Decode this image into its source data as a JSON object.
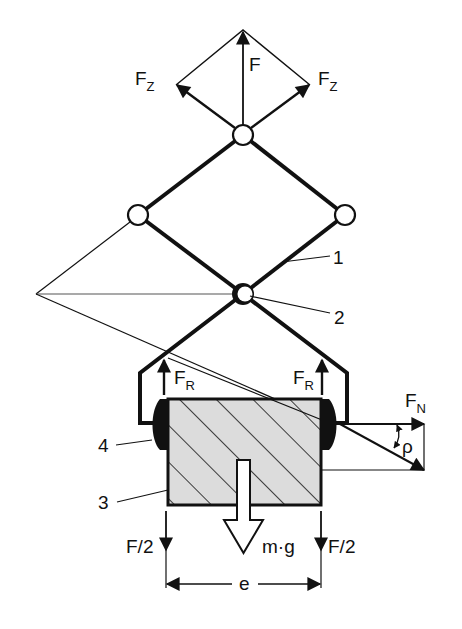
{
  "diagram": {
    "type": "mechanical-gripper-force-diagram",
    "colors": {
      "line": "#111111",
      "block_fill": "#dcdcdc",
      "background": "#ffffff"
    },
    "forces": {
      "F": {
        "main": "F",
        "sub": ""
      },
      "Fz_left": {
        "main": "F",
        "sub": "Z"
      },
      "Fz_right": {
        "main": "F",
        "sub": "Z"
      },
      "Fr_left": {
        "main": "F",
        "sub": "R"
      },
      "Fr_right": {
        "main": "F",
        "sub": "R"
      },
      "Fn": {
        "main": "F",
        "sub": "N"
      },
      "rho": "ρ",
      "weight": "m·g",
      "half_left": "F/2",
      "half_right": "F/2",
      "distance": "e"
    },
    "callouts": {
      "c1": "1",
      "c2": "2",
      "c3": "3",
      "c4": "4"
    },
    "parts": [
      {
        "id": "1",
        "name": "lever-arm"
      },
      {
        "id": "2",
        "name": "central-pivot"
      },
      {
        "id": "3",
        "name": "workpiece-block"
      },
      {
        "id": "4",
        "name": "gripper-jaw-pad"
      }
    ]
  }
}
